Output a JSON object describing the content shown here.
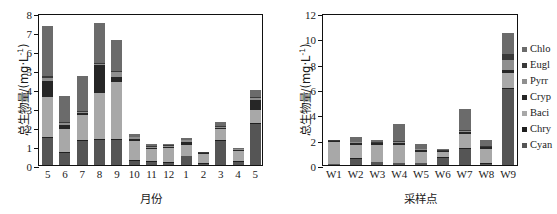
{
  "chart_data": [
    {
      "type": "bar",
      "stacked": true,
      "panel": "left",
      "title": "",
      "xlabel": "月份",
      "ylabel": "总生物量/(mg·L⁻¹)",
      "ylabel_main": "总生物量/(mg·L",
      "ylabel_sup": "-1",
      "ylabel_tail": ")",
      "ylim": [
        0,
        8
      ],
      "yticks": [
        0,
        1,
        2,
        3,
        4,
        5,
        6,
        7,
        8
      ],
      "grid": false,
      "legend_position": "none",
      "categories": [
        "5",
        "6",
        "7",
        "8",
        "9",
        "10",
        "11",
        "12",
        "1",
        "2",
        "3",
        "4",
        "5"
      ],
      "series": [
        {
          "name": "Cyan",
          "values": [
            1.4,
            0.65,
            1.25,
            1.3,
            1.3,
            0.22,
            0.18,
            0.1,
            0.45,
            0.06,
            1.25,
            0.18,
            2.15
          ]
        },
        {
          "name": "Chry",
          "values": [
            0.1,
            0.05,
            0.05,
            0.05,
            0.05,
            0.05,
            0.05,
            0.05,
            0.05,
            0.04,
            0.05,
            0.05,
            0.08
          ]
        },
        {
          "name": "Baci",
          "values": [
            2.1,
            1.2,
            1.35,
            2.45,
            3.0,
            1.0,
            0.6,
            0.75,
            0.55,
            0.48,
            0.6,
            0.5,
            0.65
          ]
        },
        {
          "name": "Cryp",
          "values": [
            0.8,
            0.2,
            0.1,
            1.45,
            0.3,
            0.12,
            0.08,
            0.05,
            0.15,
            0.05,
            0.05,
            0.05,
            0.55
          ]
        },
        {
          "name": "Pyrr",
          "values": [
            0.2,
            0.1,
            0.05,
            0.05,
            0.25,
            0.08,
            0.05,
            0.05,
            0.1,
            0.03,
            0.05,
            0.04,
            0.1
          ]
        },
        {
          "name": "Eugl",
          "values": [
            0.1,
            0.05,
            0.05,
            0.05,
            0.05,
            0.03,
            0.03,
            0.03,
            0.03,
            0.02,
            0.03,
            0.03,
            0.05
          ]
        },
        {
          "name": "Chlo",
          "values": [
            2.6,
            1.4,
            1.85,
            2.15,
            1.65,
            0.12,
            0.12,
            0.07,
            0.12,
            0.02,
            0.25,
            0.05,
            0.37
          ]
        }
      ],
      "totals": [
        7.3,
        3.65,
        4.7,
        7.5,
        6.6,
        1.62,
        1.11,
        1.1,
        1.45,
        0.7,
        2.28,
        0.9,
        3.95
      ]
    },
    {
      "type": "bar",
      "stacked": true,
      "panel": "right",
      "title": "",
      "xlabel": "采样点",
      "ylabel": "总生物量/(mg·L⁻¹)",
      "ylabel_main": "总生物量/(mg·L",
      "ylabel_sup": "-1",
      "ylabel_tail": ")",
      "ylim": [
        0,
        12
      ],
      "yticks": [
        0,
        2,
        4,
        6,
        8,
        10,
        12
      ],
      "grid": false,
      "legend_position": "right",
      "categories": [
        "W1",
        "W2",
        "W3",
        "W4",
        "W5",
        "W6",
        "W7",
        "W8",
        "W9"
      ],
      "series": [
        {
          "name": "Cyan",
          "values": [
            0.05,
            0.5,
            0.2,
            0.12,
            0.12,
            0.55,
            1.25,
            0.1,
            6.0
          ]
        },
        {
          "name": "Chry",
          "values": [
            0.03,
            0.05,
            0.05,
            0.04,
            0.04,
            0.05,
            0.08,
            0.04,
            0.1
          ]
        },
        {
          "name": "Baci",
          "values": [
            1.75,
            1.05,
            1.35,
            1.45,
            0.9,
            0.45,
            1.1,
            1.15,
            1.15
          ]
        },
        {
          "name": "Cryp",
          "values": [
            0.05,
            0.15,
            0.12,
            0.15,
            0.12,
            0.05,
            0.2,
            0.12,
            0.25
          ]
        },
        {
          "name": "Pyrr",
          "values": [
            0.03,
            0.05,
            0.05,
            0.05,
            0.05,
            0.03,
            0.08,
            0.05,
            0.8
          ]
        },
        {
          "name": "Eugl",
          "values": [
            0.03,
            0.05,
            0.05,
            0.05,
            0.05,
            0.03,
            0.08,
            0.05,
            0.45
          ]
        },
        {
          "name": "Chlo",
          "values": [
            0.02,
            0.4,
            0.12,
            1.4,
            0.42,
            0.1,
            1.6,
            0.5,
            1.65
          ]
        }
      ],
      "totals": [
        1.96,
        2.25,
        1.94,
        3.26,
        1.7,
        1.26,
        4.39,
        2.01,
        10.4
      ]
    }
  ],
  "legend": {
    "items": [
      {
        "label": "Chlo",
        "color": "#6b6b6b"
      },
      {
        "label": "Eugl",
        "color": "#3a3a3a"
      },
      {
        "label": "Pyrr",
        "color": "#8f8f8f"
      },
      {
        "label": "Cryp",
        "color": "#262626"
      },
      {
        "label": "Baci",
        "color": "#a8a8a8"
      },
      {
        "label": "Chry",
        "color": "#1f1f1f"
      },
      {
        "label": "Cyan",
        "color": "#555555"
      }
    ]
  },
  "colors": {
    "Cyan": "#555555",
    "Chry": "#1f1f1f",
    "Baci": "#a8a8a8",
    "Cryp": "#262626",
    "Pyrr": "#8f8f8f",
    "Eugl": "#3a3a3a",
    "Chlo": "#6b6b6b",
    "axis": "#111111",
    "background": "#ffffff"
  }
}
